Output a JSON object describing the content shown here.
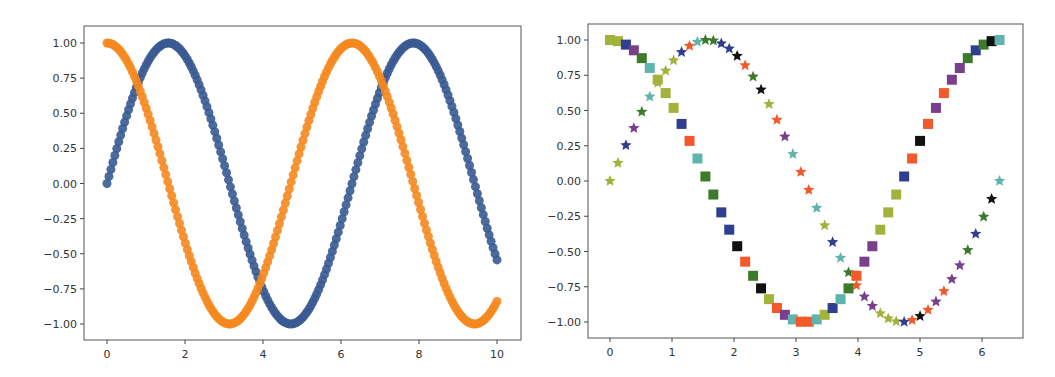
{
  "chart_data": [
    {
      "type": "scatter",
      "title": "",
      "xlabel": "",
      "ylabel": "",
      "xlim": [
        -0.6,
        10.6
      ],
      "ylim": [
        -1.12,
        1.12
      ],
      "x_ticks": [
        0,
        2,
        4,
        6,
        8,
        10
      ],
      "x_tick_labels": [
        "0",
        "2",
        "4",
        "6",
        "8",
        "10"
      ],
      "y_ticks": [
        1.0,
        0.75,
        0.5,
        0.25,
        0.0,
        -0.25,
        -0.5,
        -0.75,
        -1.0
      ],
      "y_tick_labels": [
        "1.00",
        "0.75",
        "0.50",
        "0.25",
        "0.00",
        "−0.25",
        "−0.50",
        "−0.75",
        "−1.00"
      ],
      "grid": false,
      "legend": null,
      "x_range": [
        0,
        10
      ],
      "num_points": 200,
      "series": [
        {
          "name": "sin(x)",
          "function": "sin",
          "color": "#3a5a92",
          "marker": "o",
          "marker_size": 9
        },
        {
          "name": "cos(x)",
          "function": "cos",
          "color": "#f5881f",
          "marker": "o",
          "marker_size": 9
        }
      ],
      "sample_points": {
        "x": [
          0,
          1,
          2,
          3,
          4,
          5,
          6,
          7,
          8,
          9,
          10
        ],
        "sin": [
          0.0,
          0.84,
          0.91,
          0.14,
          -0.76,
          -0.96,
          -0.28,
          0.66,
          0.99,
          0.41,
          -0.54
        ],
        "cos": [
          1.0,
          0.54,
          -0.42,
          -0.99,
          -0.65,
          0.28,
          0.96,
          0.75,
          -0.15,
          -0.91,
          -0.84
        ]
      }
    },
    {
      "type": "scatter",
      "title": "",
      "xlabel": "",
      "ylabel": "",
      "xlim": [
        -0.35,
        6.63
      ],
      "ylim": [
        -1.12,
        1.12
      ],
      "x_ticks": [
        0,
        1,
        2,
        3,
        4,
        5,
        6
      ],
      "x_tick_labels": [
        "0",
        "1",
        "2",
        "3",
        "4",
        "5",
        "6"
      ],
      "y_ticks": [
        1.0,
        0.75,
        0.5,
        0.25,
        0.0,
        -0.25,
        -0.5,
        -0.75,
        -1.0
      ],
      "y_tick_labels": [
        "1.00",
        "0.75",
        "0.50",
        "0.25",
        "0.00",
        "−0.25",
        "−0.50",
        "−0.75",
        "−1.00"
      ],
      "grid": false,
      "legend": null,
      "x_range": [
        0,
        6.2832
      ],
      "num_points": 50,
      "palette": {
        "olive": "#a3b23a",
        "blue": "#2e3f8f",
        "purple": "#7a3f8c",
        "green": "#3e7a2b",
        "teal": "#5fb5ad",
        "orange": "#f2582a",
        "black": "#111111"
      },
      "point_colors": [
        "olive",
        "olive",
        "blue",
        "purple",
        "green",
        "teal",
        "olive",
        "olive",
        "olive",
        "blue",
        "orange",
        "teal",
        "green",
        "green",
        "blue",
        "blue",
        "black",
        "orange",
        "green",
        "black",
        "olive",
        "orange",
        "purple",
        "teal",
        "orange",
        "orange",
        "teal",
        "olive",
        "blue",
        "teal",
        "green",
        "orange",
        "purple",
        "purple",
        "olive",
        "olive",
        "olive",
        "blue",
        "orange",
        "black",
        "orange",
        "purple",
        "orange",
        "purple",
        "purple",
        "green",
        "blue",
        "green",
        "black",
        "teal"
      ],
      "series": [
        {
          "name": "sin(x)",
          "function": "sin",
          "marker": "*",
          "marker_size": 7
        },
        {
          "name": "cos(x)",
          "function": "cos",
          "marker": "s",
          "marker_size": 10
        }
      ]
    }
  ]
}
